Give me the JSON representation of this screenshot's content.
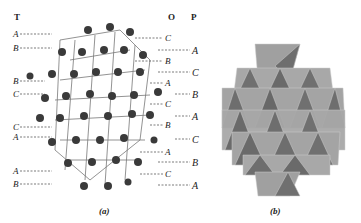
{
  "figure": {
    "panel_a": {
      "caption": "(a)",
      "headers": {
        "left": "T",
        "right_1": "O",
        "right_2": "P"
      },
      "left_labels": [
        {
          "text": "A",
          "y": 34
        },
        {
          "text": "B",
          "y": 48
        },
        {
          "text": "B",
          "y": 81
        },
        {
          "text": "C",
          "y": 94
        },
        {
          "text": "C",
          "y": 127
        },
        {
          "text": "A",
          "y": 137
        },
        {
          "text": "A",
          "y": 171
        },
        {
          "text": "B",
          "y": 184
        }
      ],
      "o_labels": [
        {
          "text": "C",
          "y": 38
        },
        {
          "text": "B",
          "y": 61
        },
        {
          "text": "A",
          "y": 83
        },
        {
          "text": "C",
          "y": 104
        },
        {
          "text": "B",
          "y": 125
        },
        {
          "text": "A",
          "y": 152
        },
        {
          "text": "C",
          "y": 174
        }
      ],
      "p_labels": [
        {
          "text": "A",
          "y": 50
        },
        {
          "text": "C",
          "y": 72
        },
        {
          "text": "B",
          "y": 94
        },
        {
          "text": "A",
          "y": 116
        },
        {
          "text": "C",
          "y": 139
        },
        {
          "text": "B",
          "y": 162
        },
        {
          "text": "A",
          "y": 185
        }
      ]
    },
    "panel_b": {
      "caption": "(b)"
    },
    "colors": {
      "atom": "#3a3a3a",
      "bond": "#777777",
      "poly_light": "#a8a8a8",
      "poly_dark": "#6e6e6e"
    }
  }
}
